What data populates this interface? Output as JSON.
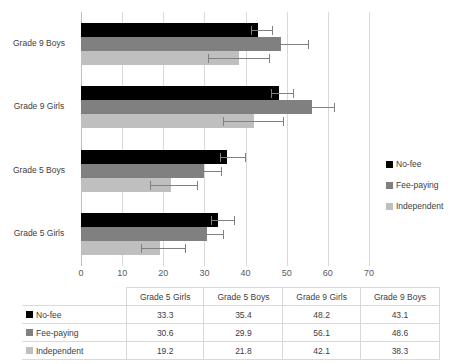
{
  "chart_data": {
    "type": "bar",
    "orientation": "horizontal",
    "title": "",
    "xlabel": "",
    "ylabel": "",
    "xlim": [
      0,
      70
    ],
    "xticks": [
      0,
      10,
      20,
      30,
      40,
      50,
      60,
      70
    ],
    "xtick_labels": [
      "0",
      "10",
      "20",
      "30",
      "40",
      "50",
      "60",
      "70"
    ],
    "grid": true,
    "legend_position": "right",
    "categories": [
      "Grade 5 Girls",
      "Grade 5 Boys",
      "Grade 9 Girls",
      "Grade 9 Boys"
    ],
    "series": [
      {
        "name": "No-fee",
        "color": "#000000",
        "values": [
          33.3,
          35.4,
          48.2,
          43.1
        ],
        "error_low": [
          1.6,
          1.7,
          2.0,
          1.9
        ],
        "error_high": [
          4.0,
          4.5,
          3.3,
          3.4
        ]
      },
      {
        "name": "Fee-paying",
        "color": "#808080",
        "values": [
          30.6,
          29.9,
          56.1,
          48.6
        ],
        "error_low": [
          2.0,
          2.0,
          2.2,
          1.9
        ],
        "error_high": [
          3.8,
          4.1,
          5.5,
          6.5
        ]
      },
      {
        "name": "Independent",
        "color": "#BFBFBF",
        "values": [
          19.2,
          21.8,
          42.1,
          38.3
        ],
        "error_low": [
          4.5,
          5.0,
          7.5,
          7.5
        ],
        "error_high": [
          6.0,
          6.5,
          7.0,
          7.5
        ]
      }
    ]
  },
  "legend": {
    "items": [
      {
        "label": "No-fee",
        "color": "#000000"
      },
      {
        "label": "Fee-paying",
        "color": "#808080"
      },
      {
        "label": "Independent",
        "color": "#BFBFBF"
      }
    ]
  },
  "table": {
    "corner_label": "",
    "columns": [
      "Grade 5 Girls",
      "Grade 5 Boys",
      "Grade 9 Girls",
      "Grade 9 Boys"
    ],
    "rows": [
      {
        "label": "No-fee",
        "color": "#000000",
        "values": [
          "33.3",
          "35.4",
          "48.2",
          "43.1"
        ]
      },
      {
        "label": "Fee-paying",
        "color": "#808080",
        "values": [
          "30.6",
          "29.9",
          "56.1",
          "48.6"
        ]
      },
      {
        "label": "Independent",
        "color": "#BFBFBF",
        "values": [
          "19.2",
          "21.8",
          "42.1",
          "38.3"
        ]
      }
    ]
  }
}
